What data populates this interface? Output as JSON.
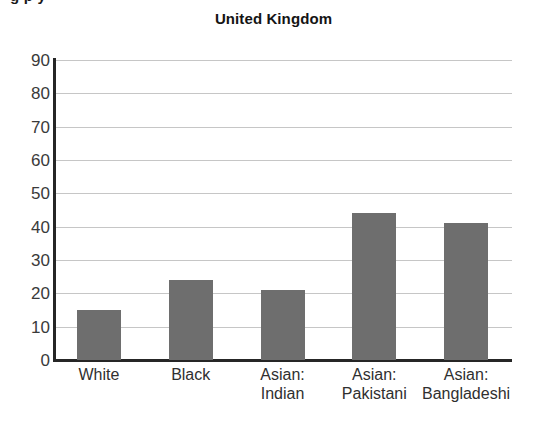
{
  "page": {
    "cropped_heading_fragment": "g p y",
    "background_color": "#ffffff"
  },
  "chart_data": {
    "type": "bar",
    "title": "United Kingdom",
    "xlabel": "",
    "ylabel": "",
    "categories": [
      "White",
      "Asian:\nIndian",
      "Black",
      "Asian:\nPakistani",
      "Asian:\nBangladeshi"
    ],
    "category_labels": [
      {
        "line1": "White",
        "line2": ""
      },
      {
        "line1": "Black",
        "line2": ""
      },
      {
        "line1": "Asian:",
        "line2": "Indian"
      },
      {
        "line1": "Asian:",
        "line2": "Pakistani"
      },
      {
        "line1": "Asian:",
        "line2": "Bangladeshi"
      }
    ],
    "values": [
      15,
      24,
      21,
      44,
      41
    ],
    "ylim": [
      0,
      90
    ],
    "ytick_step": 10,
    "yticks": [
      90,
      80,
      70,
      60,
      50,
      40,
      30,
      20,
      10,
      0
    ],
    "grid": true,
    "grid_axis": "y",
    "legend": "none",
    "bar_color": "#6e6e6e",
    "grid_color": "#c6c6c6",
    "axis_color": "#262626"
  }
}
